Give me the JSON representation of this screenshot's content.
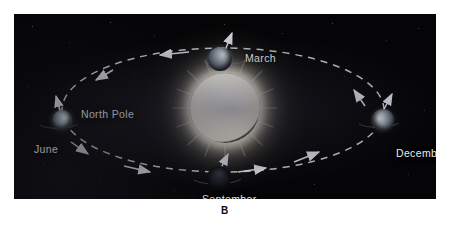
{
  "figure": {
    "caption": "B",
    "panel_background": "#050507",
    "page_background": "#ffffff",
    "label_color": "#e9ecef"
  },
  "sun": {
    "name": "Sun",
    "color": "#fffdf0",
    "corona_color": "#fff8d7"
  },
  "orbit": {
    "style": "dashed-ellipse",
    "color": "#d2d6de",
    "direction_note": "arrows indicate direction of Earth's revolution"
  },
  "labels": {
    "march": "March",
    "june": "June",
    "september": "September",
    "december": "December",
    "north_pole": "North Pole"
  },
  "positions": [
    {
      "id": "march",
      "label": "March",
      "lit_side": "left-front"
    },
    {
      "id": "june",
      "label": "June",
      "lit_side": "right"
    },
    {
      "id": "september",
      "label": "September",
      "lit_side": "far-side"
    },
    {
      "id": "december",
      "label": "December",
      "lit_side": "left"
    }
  ]
}
